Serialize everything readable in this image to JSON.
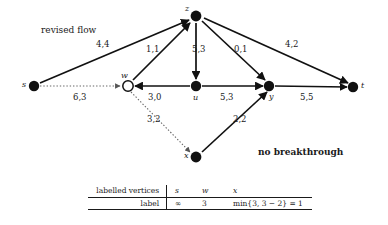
{
  "diagram": {
    "title_annotation": "revised flow",
    "status_annotation": "no breakthrough",
    "nodes": [
      {
        "id": "s",
        "label": "s",
        "x": 34,
        "y": 86,
        "filled": true,
        "label_dx": -9,
        "label_dy": -4
      },
      {
        "id": "w",
        "label": "w",
        "x": 128,
        "y": 86,
        "filled": false,
        "label_dx": -5,
        "label_dy": -13
      },
      {
        "id": "z",
        "label": "z",
        "x": 196,
        "y": 16,
        "filled": true,
        "label_dx": -9,
        "label_dy": -10
      },
      {
        "id": "u",
        "label": "u",
        "x": 196,
        "y": 86,
        "filled": true,
        "label_dx": -2,
        "label_dy": 7
      },
      {
        "id": "y",
        "label": "y",
        "x": 269,
        "y": 86,
        "filled": true,
        "label_dx": 1,
        "label_dy": 6
      },
      {
        "id": "t",
        "label": "t",
        "x": 353,
        "y": 87,
        "filled": true,
        "label_dx": 7,
        "label_dy": -4
      },
      {
        "id": "x",
        "label": "x",
        "x": 196,
        "y": 157,
        "filled": true,
        "label_dx": -10,
        "label_dy": -3
      }
    ],
    "edges": [
      {
        "from": "s",
        "to": "z",
        "label": "4,4",
        "style": "solid",
        "label_x": 103,
        "label_y": 45
      },
      {
        "from": "s",
        "to": "w",
        "label": "6,3",
        "style": "dotted",
        "label_x": 80,
        "label_y": 97
      },
      {
        "from": "w",
        "to": "z",
        "label": "1,1",
        "style": "solid",
        "label_x": 152,
        "label_y": 50
      },
      {
        "from": "z",
        "to": "u",
        "label": "5,3",
        "style": "solid",
        "label_x": 199,
        "label_y": 50
      },
      {
        "from": "z",
        "to": "y",
        "label": "0,1",
        "style": "solid",
        "label_x": 241,
        "label_y": 50
      },
      {
        "from": "z",
        "to": "t",
        "label": "4,2",
        "style": "solid",
        "label_x": 291,
        "label_y": 45
      },
      {
        "from": "u",
        "to": "w",
        "label": "3,0",
        "style": "solid",
        "label_x": 155,
        "label_y": 97
      },
      {
        "from": "u",
        "to": "y",
        "label": "5,3",
        "style": "solid",
        "label_x": 226,
        "label_y": 97
      },
      {
        "from": "y",
        "to": "t",
        "label": "5,5",
        "style": "solid",
        "label_x": 306,
        "label_y": 97
      },
      {
        "from": "w",
        "to": "x",
        "label": "3,2",
        "style": "dotted",
        "label_x": 153,
        "label_y": 120
      },
      {
        "from": "x",
        "to": "y",
        "label": "2,2",
        "style": "solid",
        "label_x": 239,
        "label_y": 120
      }
    ]
  },
  "table": {
    "row_header_1": "labelled vertices",
    "row_header_2": "label",
    "vertices": [
      "s",
      "w",
      "x"
    ],
    "labels": [
      "∞",
      "3",
      "min{3, 3 − 2} = 1"
    ]
  }
}
